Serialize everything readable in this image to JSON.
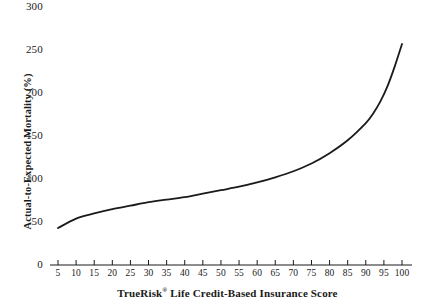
{
  "chart_data": {
    "type": "line",
    "title": "",
    "xlabel": "TrueRisk® Life Credit-Based Insurance Score",
    "xlabel_prefix": "TrueRisk",
    "xlabel_mark": "®",
    "xlabel_suffix": " Life Credit-Based Insurance Score",
    "ylabel": "Actual-to-Expected Mortality (%)",
    "xlim": [
      5,
      100
    ],
    "ylim": [
      0,
      300
    ],
    "grid": false,
    "legend": "none",
    "line_color": "#1a1a1a",
    "line_width": 1.8,
    "x_ticks": [
      5,
      10,
      15,
      20,
      25,
      30,
      35,
      40,
      45,
      50,
      55,
      60,
      65,
      70,
      75,
      80,
      85,
      90,
      95,
      100
    ],
    "y_ticks": [
      0,
      50,
      100,
      150,
      200,
      250,
      300
    ],
    "x": [
      5,
      10,
      15,
      20,
      25,
      30,
      35,
      40,
      45,
      50,
      55,
      60,
      65,
      70,
      75,
      80,
      85,
      90,
      92,
      94,
      96,
      98,
      100
    ],
    "values": [
      43,
      54,
      60,
      65,
      69,
      73,
      76,
      79,
      83,
      87,
      91,
      96,
      102,
      109,
      118,
      130,
      145,
      165,
      176,
      190,
      208,
      231,
      257
    ],
    "series": [
      {
        "name": "Actual-to-Expected Mortality",
        "values": [
          43,
          54,
          60,
          65,
          69,
          73,
          76,
          79,
          83,
          87,
          91,
          96,
          102,
          109,
          118,
          130,
          145,
          165,
          176,
          190,
          208,
          231,
          257
        ]
      }
    ]
  }
}
